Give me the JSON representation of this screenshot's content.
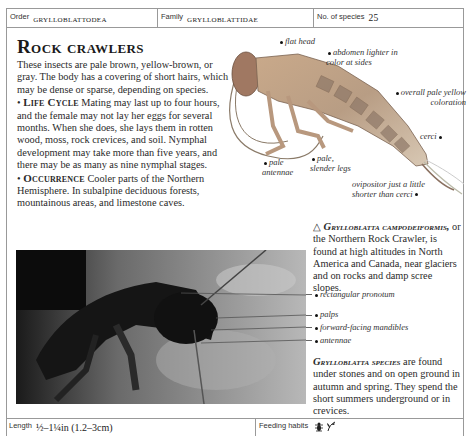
{
  "header": {
    "order_label": "Order",
    "order_value": "Grylloblattodea",
    "family_label": "Family",
    "family_value": "Grylloblattidae",
    "species_label": "No. of species",
    "species_value": "25"
  },
  "title": "Rock crawlers",
  "intro": "These insects are pale brown, yellow-brown, or gray. The body has a covering of short hairs, which may be dense or sparse, depending on species.",
  "life_cycle": {
    "heading": "Life Cycle",
    "text": "Mating may last up to four hours, and the female may not lay her eggs for several months. When she does, she lays them in rotten wood, moss, rock crevices, and soil. Nymphal development may take more than five years, and there may be as many as nine nymphal stages."
  },
  "occurrence": {
    "heading": "Occurrence",
    "text": "Cooler parts of the Northern Hemisphere. In subalpine deciduous forests, mountainous areas, and limestone caves."
  },
  "illustration_annotations": [
    {
      "text": "flat head"
    },
    {
      "text": "abdomen lighter in color at sides"
    },
    {
      "text": "overall pale yellow coloration"
    },
    {
      "text": "cerci"
    },
    {
      "text": "pale antennae"
    },
    {
      "text": "pale, slender legs"
    },
    {
      "text": "ovipositor just a little shorter than cerci"
    }
  ],
  "species_note": {
    "symbol": "△",
    "name": "Grylloblatta campodeiformis,",
    "text": "or the Northern Rock Crawler, is found at high altitudes in North America and Canada, near glaciers and on rocks and damp scree slopes."
  },
  "photo_annotations": [
    {
      "text": "rectangular pronotum"
    },
    {
      "text": "palps"
    },
    {
      "text": "forward-facing mandibles"
    },
    {
      "text": "antennae"
    }
  ],
  "genus_note": {
    "name": "Grylloblatta species",
    "text": "are found under stones and on open ground in autumn and spring. They spend the short summers underground or in crevices."
  },
  "footer": {
    "length_label": "Length",
    "length_value": "½–1¼in (1.2–3cm)",
    "feeding_label": "Feeding habits",
    "feeding_icons": [
      "insect-icon",
      "plant-icon"
    ]
  }
}
